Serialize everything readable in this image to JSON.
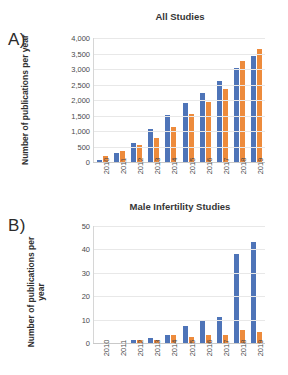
{
  "figure": {
    "background": "#ffffff",
    "series_colors": {
      "series1": "#4e74b8",
      "series2": "#ed8b3c"
    }
  },
  "panels": [
    {
      "letter": "A)",
      "title": "All Studies",
      "ylabel": "Number of publications per year"
    },
    {
      "letter": "B)",
      "title": "Male Infertility Studies",
      "ylabel_line1": "Number of publications per",
      "ylabel_line2": "year"
    }
  ],
  "chart_data": [
    {
      "type": "bar",
      "title": "All Studies",
      "xlabel": "",
      "ylabel": "Number of publications per year",
      "categories": [
        "2010",
        "2011",
        "2012",
        "2013",
        "2014",
        "2015",
        "2016",
        "2017",
        "2018",
        "2019"
      ],
      "series": [
        {
          "name": "series1",
          "color": "#4e74b8",
          "values": [
            80,
            300,
            600,
            1080,
            1520,
            1910,
            2220,
            2620,
            3030,
            3430
          ]
        },
        {
          "name": "series2",
          "color": "#ed8b3c",
          "values": [
            210,
            340,
            550,
            760,
            1130,
            1550,
            1950,
            2370,
            3250,
            3630
          ]
        }
      ],
      "ylim": [
        0,
        4000
      ],
      "yticks": [
        "0",
        "500",
        "1,000",
        "1,500",
        "2,000",
        "2,500",
        "3,000",
        "3,500",
        "4,000"
      ],
      "ytick_values": [
        0,
        500,
        1000,
        1500,
        2000,
        2500,
        3000,
        3500,
        4000
      ],
      "grid": true,
      "legend": "none"
    },
    {
      "type": "bar",
      "title": "Male Infertility Studies",
      "xlabel": "",
      "ylabel": "Number of publications per year",
      "categories": [
        "2010",
        "2011",
        "2012",
        "2013",
        "2014",
        "2015",
        "2016",
        "2017",
        "2018",
        "2019"
      ],
      "series": [
        {
          "name": "series1",
          "color": "#4e74b8",
          "values": [
            0,
            0,
            1.5,
            2,
            3.3,
            7.3,
            9.3,
            11.3,
            38,
            43
          ]
        },
        {
          "name": "series2",
          "color": "#ed8b3c",
          "values": [
            0,
            0,
            1.5,
            1.4,
            3.4,
            2.6,
            3.6,
            3.6,
            5.4,
            4.6
          ]
        }
      ],
      "ylim": [
        0,
        50
      ],
      "yticks": [
        "0",
        "10",
        "20",
        "30",
        "40",
        "50"
      ],
      "ytick_values": [
        0,
        10,
        20,
        30,
        40,
        50
      ],
      "grid": true,
      "legend": "none"
    }
  ]
}
